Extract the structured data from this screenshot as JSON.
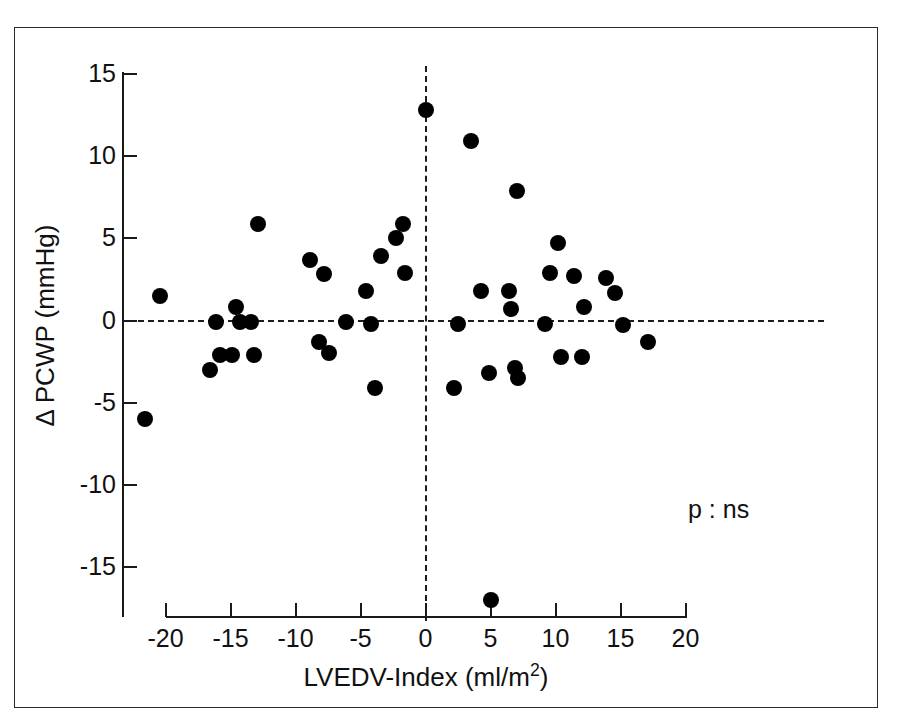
{
  "figure": {
    "annotation": "p : ns",
    "marker_color": "#000000",
    "axis_color": "#1a1a1a",
    "frame_color": "#2b2b2b",
    "background": "#ffffff"
  },
  "chart_data": {
    "type": "scatter",
    "title": "",
    "xlabel": "LVEDV-Index (ml/m2)",
    "xlabel_base": "LVEDV-Index (ml/m",
    "xlabel_sup": "2",
    "xlabel_tail": ")",
    "ylabel": "Δ PCWP  (mmHg)",
    "xlim": [
      -20,
      20
    ],
    "ylim": [
      -15,
      15
    ],
    "xticks": [
      -20,
      -15,
      -10,
      -5,
      0,
      5,
      10,
      15,
      20
    ],
    "xticklabels": [
      "-20",
      "-15",
      "-10",
      "-5",
      "0",
      "5",
      "10",
      "15",
      "20"
    ],
    "yticks": [
      -15,
      -10,
      -5,
      0,
      5,
      10,
      15
    ],
    "yticklabels": [
      "-15",
      "-10",
      "-5",
      "0",
      "5",
      "10",
      "15"
    ],
    "grid": false,
    "legend": null,
    "reference_lines": [
      {
        "orientation": "horizontal",
        "value": 0,
        "style": "dashed"
      },
      {
        "orientation": "vertical",
        "value": 0,
        "style": "dashed"
      }
    ],
    "annotations": [
      {
        "text": "p : ns",
        "x": 11.5,
        "y": -11.5
      }
    ],
    "points": [
      {
        "x": -21.6,
        "y": -6.0
      },
      {
        "x": -20.4,
        "y": 1.5
      },
      {
        "x": -16.6,
        "y": -3.0
      },
      {
        "x": -16.1,
        "y": -0.1
      },
      {
        "x": -15.8,
        "y": -2.1
      },
      {
        "x": -14.9,
        "y": -2.1
      },
      {
        "x": -14.6,
        "y": 0.8
      },
      {
        "x": -14.3,
        "y": -0.1
      },
      {
        "x": -13.4,
        "y": -0.1
      },
      {
        "x": -13.2,
        "y": -2.1
      },
      {
        "x": -12.9,
        "y": 5.9
      },
      {
        "x": -8.9,
        "y": 3.7
      },
      {
        "x": -8.2,
        "y": -1.3
      },
      {
        "x": -7.8,
        "y": 2.8
      },
      {
        "x": -7.4,
        "y": -2.0
      },
      {
        "x": -6.1,
        "y": -0.1
      },
      {
        "x": -4.6,
        "y": 1.8
      },
      {
        "x": -4.2,
        "y": -0.2
      },
      {
        "x": -3.9,
        "y": -4.1
      },
      {
        "x": -3.4,
        "y": 3.9
      },
      {
        "x": -2.3,
        "y": 5.0
      },
      {
        "x": -1.7,
        "y": 5.9
      },
      {
        "x": -1.6,
        "y": 2.9
      },
      {
        "x": 0.0,
        "y": 12.8
      },
      {
        "x": 2.2,
        "y": -4.1
      },
      {
        "x": 2.5,
        "y": -0.2
      },
      {
        "x": 3.5,
        "y": 10.9
      },
      {
        "x": 4.3,
        "y": 1.8
      },
      {
        "x": 4.9,
        "y": -3.2
      },
      {
        "x": 5.0,
        "y": -17.0
      },
      {
        "x": 6.4,
        "y": 1.8
      },
      {
        "x": 6.6,
        "y": 0.7
      },
      {
        "x": 6.9,
        "y": -2.9
      },
      {
        "x": 7.0,
        "y": 7.9
      },
      {
        "x": 7.1,
        "y": -3.5
      },
      {
        "x": 9.2,
        "y": -0.2
      },
      {
        "x": 9.6,
        "y": 2.9
      },
      {
        "x": 10.2,
        "y": 4.7
      },
      {
        "x": 10.4,
        "y": -2.2
      },
      {
        "x": 11.4,
        "y": 2.7
      },
      {
        "x": 12.0,
        "y": -2.2
      },
      {
        "x": 12.2,
        "y": 0.8
      },
      {
        "x": 13.9,
        "y": 2.6
      },
      {
        "x": 14.6,
        "y": 1.7
      },
      {
        "x": 15.2,
        "y": -0.3
      },
      {
        "x": 17.1,
        "y": -1.3
      }
    ]
  }
}
